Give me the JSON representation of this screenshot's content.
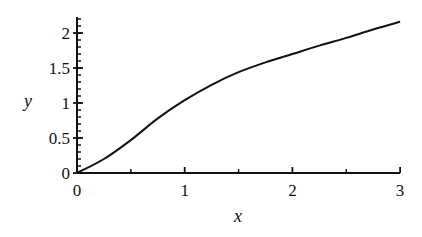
{
  "chart_data": {
    "type": "line",
    "title": "",
    "xlabel": "x",
    "ylabel": "y",
    "xlim": [
      0,
      3
    ],
    "ylim": [
      0,
      2.2
    ],
    "grid": false,
    "legend": null,
    "x_ticks": [
      0,
      1,
      2,
      3
    ],
    "x_tick_labels": [
      "0",
      "1",
      "2",
      "3"
    ],
    "x_minor_ticks": [
      0.5,
      1.5,
      2.5
    ],
    "y_ticks": [
      0,
      0.5,
      1,
      1.5,
      2
    ],
    "y_tick_labels": [
      "0",
      "0.5",
      "1",
      "1.5",
      "2"
    ],
    "y_minor_tick_step": 0.1,
    "series": [
      {
        "name": "y(x)",
        "color": "#111111",
        "x": [
          0,
          0.25,
          0.5,
          0.75,
          1,
          1.25,
          1.5,
          1.75,
          2,
          2.25,
          2.5,
          2.75,
          3
        ],
        "values": [
          0,
          0.2,
          0.47,
          0.78,
          1.04,
          1.26,
          1.44,
          1.58,
          1.7,
          1.82,
          1.93,
          2.05,
          2.16
        ]
      }
    ]
  },
  "axes": {
    "x_label": "x",
    "y_label": "y"
  }
}
